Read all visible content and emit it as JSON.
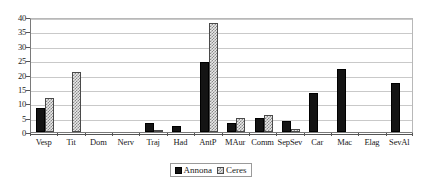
{
  "chart_data": {
    "type": "bar",
    "title": "",
    "subtitle": "",
    "xlabel": "",
    "ylabel": "",
    "ylim": [
      0,
      40
    ],
    "ytick_interval": 5,
    "yticks": [
      0,
      5,
      10,
      15,
      20,
      25,
      30,
      35,
      40
    ],
    "ytick_labels": [
      "0",
      "5",
      "10",
      "15",
      "20",
      "25",
      "30",
      "35",
      "40"
    ],
    "grid": true,
    "grid_axis": "y",
    "legend_position": "bottom-center",
    "categories": [
      "Vesp",
      "Tit",
      "Dom",
      "Nerv",
      "Traj",
      "Had",
      "AntP",
      "MAur",
      "Comm",
      "SepSev",
      "Car",
      "Mac",
      "Elag",
      "SevAl"
    ],
    "series": [
      {
        "name": "Annona",
        "color": "#141414",
        "fill": "solid-black",
        "values": [
          8.5,
          0,
          0,
          0,
          3,
          2,
          24.5,
          3,
          5,
          4,
          13.5,
          22,
          0,
          17
        ]
      },
      {
        "name": "Ceres",
        "color": "#8a8a8a",
        "fill": "checkered-gray",
        "values": [
          12,
          21,
          0,
          0,
          0.5,
          0,
          38,
          5,
          6,
          1,
          0,
          0,
          0,
          0
        ]
      }
    ],
    "annotations": []
  },
  "legend": {
    "entries": [
      {
        "label": "Annona",
        "swatch": "solid-black-square"
      },
      {
        "label": "Ceres",
        "swatch": "checkered-gray-square"
      }
    ]
  },
  "colors": {
    "annona": "#141414",
    "ceres": "#8a8a8a",
    "gridline": "#c9c9c9",
    "axis": "#555555",
    "background": "#ffffff",
    "text": "#1a1a1a"
  }
}
